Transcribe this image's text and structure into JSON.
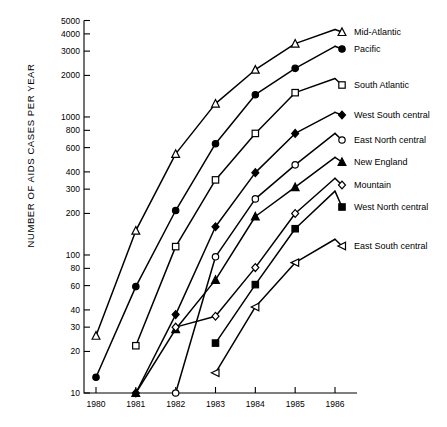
{
  "chart_data": {
    "type": "line",
    "title": "",
    "subtitle": "",
    "xlabel": "",
    "ylabel": "NUMBER OF AIDS CASES PER YEAR",
    "yscale": "log",
    "ylim": [
      10,
      5000
    ],
    "xlim": [
      1980,
      1986
    ],
    "grid": false,
    "legend_position": "right-of-plot (line-end labels)",
    "x": [
      1980,
      1981,
      1982,
      1983,
      1984,
      1985,
      1986
    ],
    "ytick_labels": [
      "10",
      "20",
      "30",
      "40",
      "60",
      "80",
      "100",
      "200",
      "300",
      "400",
      "600",
      "800",
      "1000",
      "2000",
      "3000",
      "4000",
      "5000"
    ],
    "ytick_values": [
      10,
      20,
      30,
      40,
      60,
      80,
      100,
      200,
      300,
      400,
      600,
      800,
      1000,
      2000,
      3000,
      4000,
      5000
    ],
    "xtick_labels": [
      "1980",
      "1981",
      "1982",
      "1983",
      "1984",
      "1985",
      "1986"
    ],
    "series": [
      {
        "name": "Mid-Atlantic",
        "marker": "triangle-up-open",
        "x": [
          1980,
          1981,
          1982,
          1983,
          1984,
          1985,
          1986
        ],
        "values": [
          26,
          150,
          540,
          1250,
          2200,
          3400,
          4300
        ]
      },
      {
        "name": "Pacific",
        "marker": "circle-filled",
        "x": [
          1980,
          1981,
          1982,
          1983,
          1984,
          1985,
          1986
        ],
        "values": [
          13,
          59,
          210,
          640,
          1450,
          2250,
          3250
        ]
      },
      {
        "name": "South Atlantic",
        "marker": "square-open",
        "x": [
          1981,
          1982,
          1983,
          1984,
          1985,
          1986
        ],
        "values": [
          22,
          115,
          350,
          760,
          1500,
          1900
        ]
      },
      {
        "name": "West South central",
        "marker": "diamond-filled",
        "x": [
          1981,
          1982,
          1983,
          1984,
          1985,
          1986
        ],
        "values": [
          10,
          37,
          160,
          395,
          760,
          1080
        ]
      },
      {
        "name": "East North central",
        "marker": "circle-open",
        "x": [
          1982,
          1983,
          1984,
          1985,
          1986
        ],
        "values": [
          10,
          97,
          255,
          450,
          760
        ]
      },
      {
        "name": "New England",
        "marker": "triangle-up-filled",
        "x": [
          1981,
          1982,
          1983,
          1984,
          1985,
          1986
        ],
        "values": [
          10,
          29,
          66,
          190,
          310,
          510
        ]
      },
      {
        "name": "Mountain",
        "marker": "diamond-open",
        "x": [
          1982,
          1983,
          1984,
          1985,
          1986
        ],
        "values": [
          30,
          36,
          81,
          200,
          360
        ]
      },
      {
        "name": "West North central",
        "marker": "square-filled",
        "x": [
          1983,
          1984,
          1985,
          1986
        ],
        "values": [
          23,
          61,
          155,
          290
        ]
      },
      {
        "name": "East South central",
        "marker": "triangle-left-open",
        "x": [
          1983,
          1984,
          1985,
          1986
        ],
        "values": [
          14,
          42,
          88,
          130
        ]
      }
    ],
    "legend_entries": [
      {
        "label": "Mid-Atlantic",
        "marker": "triangle-up-open"
      },
      {
        "label": "Pacific",
        "marker": "circle-filled"
      },
      {
        "label": "South Atlantic",
        "marker": "square-open"
      },
      {
        "label": "West South central",
        "marker": "diamond-filled"
      },
      {
        "label": "East North central",
        "marker": "circle-open"
      },
      {
        "label": "New England",
        "marker": "triangle-up-filled"
      },
      {
        "label": "Mountain",
        "marker": "diamond-open"
      },
      {
        "label": "West North central",
        "marker": "square-filled"
      },
      {
        "label": "East South central",
        "marker": "triangle-left-open"
      }
    ]
  },
  "colors": {
    "ink": "#000000",
    "paper": "#ffffff"
  }
}
